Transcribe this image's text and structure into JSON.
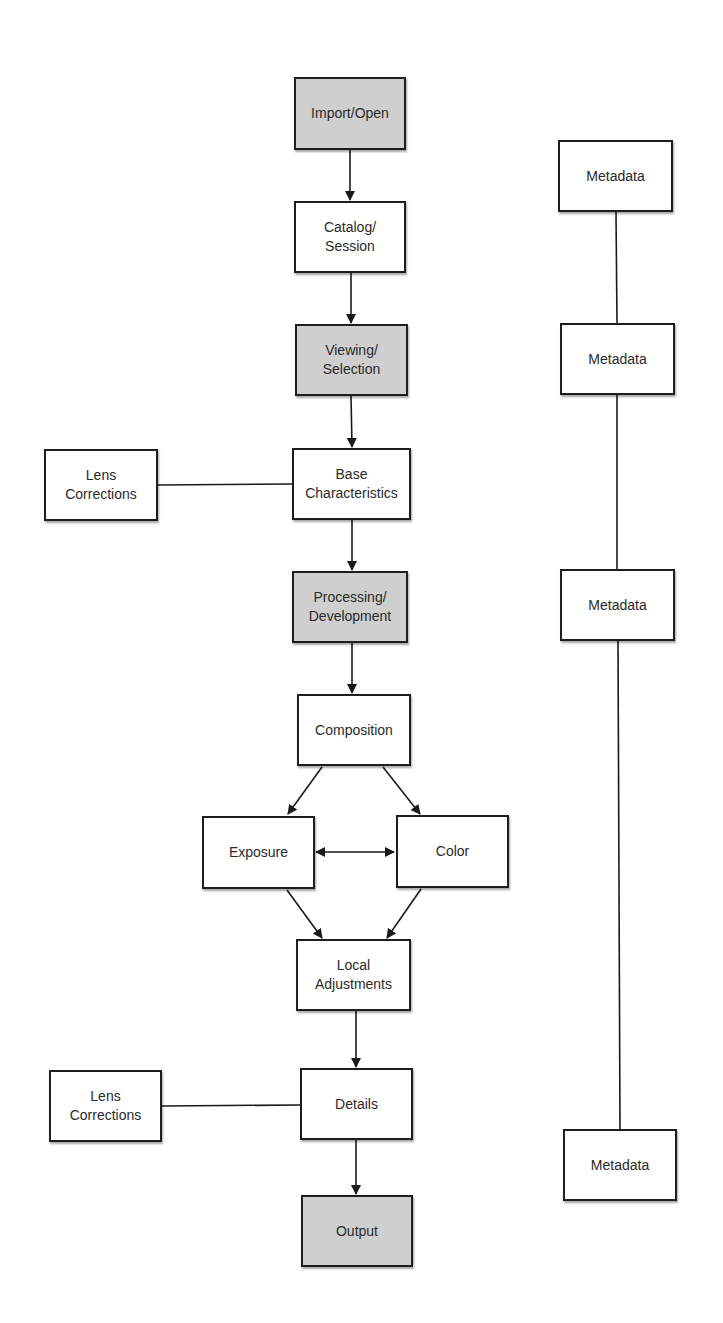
{
  "diagram": {
    "type": "flowchart",
    "background": "#ffffff",
    "colors": {
      "border": "#1e1e1e",
      "text": "#2a2a2a",
      "shaded_fill": "#cfcfcf",
      "plain_fill": "#ffffff",
      "edge": "#1a1a1a"
    },
    "nodes": [
      {
        "id": "import_open",
        "label": "Import/Open",
        "shaded": true,
        "x": 294,
        "y": 77,
        "w": 112,
        "h": 73
      },
      {
        "id": "catalog_session",
        "label": "Catalog/\nSession",
        "shaded": false,
        "x": 294,
        "y": 201,
        "w": 112,
        "h": 72
      },
      {
        "id": "viewing_selection",
        "label": "Viewing/\nSelection",
        "shaded": true,
        "x": 295,
        "y": 324,
        "w": 113,
        "h": 72
      },
      {
        "id": "base_characteristics",
        "label": "Base\nCharacteristics",
        "shaded": false,
        "x": 292,
        "y": 448,
        "w": 119,
        "h": 72
      },
      {
        "id": "lens_corrections_1",
        "label": "Lens\nCorrections",
        "shaded": false,
        "x": 44,
        "y": 449,
        "w": 114,
        "h": 72
      },
      {
        "id": "processing_development",
        "label": "Processing/\nDevelopment",
        "shaded": true,
        "x": 292,
        "y": 571,
        "w": 116,
        "h": 72
      },
      {
        "id": "composition",
        "label": "Composition",
        "shaded": false,
        "x": 297,
        "y": 694,
        "w": 114,
        "h": 72
      },
      {
        "id": "exposure",
        "label": "Exposure",
        "shaded": false,
        "x": 202,
        "y": 816,
        "w": 113,
        "h": 73
      },
      {
        "id": "color",
        "label": "Color",
        "shaded": false,
        "x": 396,
        "y": 815,
        "w": 113,
        "h": 73
      },
      {
        "id": "local_adjustments",
        "label": "Local\nAdjustments",
        "shaded": false,
        "x": 296,
        "y": 939,
        "w": 115,
        "h": 72
      },
      {
        "id": "details",
        "label": "Details",
        "shaded": false,
        "x": 300,
        "y": 1068,
        "w": 113,
        "h": 72
      },
      {
        "id": "lens_corrections_2",
        "label": "Lens\nCorrections",
        "shaded": false,
        "x": 49,
        "y": 1070,
        "w": 113,
        "h": 72
      },
      {
        "id": "output",
        "label": "Output",
        "shaded": true,
        "x": 301,
        "y": 1195,
        "w": 112,
        "h": 72
      },
      {
        "id": "metadata_1",
        "label": "Metadata",
        "shaded": false,
        "x": 558,
        "y": 140,
        "w": 115,
        "h": 72
      },
      {
        "id": "metadata_2",
        "label": "Metadata",
        "shaded": false,
        "x": 560,
        "y": 323,
        "w": 115,
        "h": 72
      },
      {
        "id": "metadata_3",
        "label": "Metadata",
        "shaded": false,
        "x": 560,
        "y": 569,
        "w": 115,
        "h": 72
      },
      {
        "id": "metadata_4",
        "label": "Metadata",
        "shaded": false,
        "x": 563,
        "y": 1129,
        "w": 114,
        "h": 72
      }
    ],
    "edges": [
      {
        "from": "import_open",
        "to": "catalog_session",
        "type": "arrow",
        "x1": 350,
        "y1": 150,
        "x2": 350,
        "y2": 200
      },
      {
        "from": "catalog_session",
        "to": "viewing_selection",
        "type": "arrow",
        "x1": 351,
        "y1": 273,
        "x2": 351,
        "y2": 323
      },
      {
        "from": "viewing_selection",
        "to": "base_characteristics",
        "type": "arrow",
        "x1": 351,
        "y1": 396,
        "x2": 352,
        "y2": 447
      },
      {
        "from": "lens_corrections_1",
        "to": "base_characteristics",
        "type": "line",
        "x1": 158,
        "y1": 485,
        "x2": 292,
        "y2": 484
      },
      {
        "from": "base_characteristics",
        "to": "processing_development",
        "type": "arrow",
        "x1": 352,
        "y1": 520,
        "x2": 352,
        "y2": 570
      },
      {
        "from": "processing_development",
        "to": "composition",
        "type": "arrow",
        "x1": 352,
        "y1": 643,
        "x2": 352,
        "y2": 693
      },
      {
        "from": "composition",
        "to": "exposure",
        "type": "arrow",
        "x1": 322,
        "y1": 767,
        "x2": 288,
        "y2": 814
      },
      {
        "from": "composition",
        "to": "color",
        "type": "arrow",
        "x1": 383,
        "y1": 767,
        "x2": 420,
        "y2": 814
      },
      {
        "from": "exposure",
        "to": "color",
        "type": "double-arrow",
        "x1": 316,
        "y1": 852,
        "x2": 394,
        "y2": 852
      },
      {
        "from": "exposure",
        "to": "local_adjustments",
        "type": "arrow",
        "x1": 287,
        "y1": 890,
        "x2": 322,
        "y2": 938
      },
      {
        "from": "color",
        "to": "local_adjustments",
        "type": "arrow",
        "x1": 421,
        "y1": 889,
        "x2": 387,
        "y2": 938
      },
      {
        "from": "local_adjustments",
        "to": "details",
        "type": "arrow",
        "x1": 356,
        "y1": 1011,
        "x2": 356,
        "y2": 1067
      },
      {
        "from": "lens_corrections_2",
        "to": "details",
        "type": "line",
        "x1": 162,
        "y1": 1106,
        "x2": 300,
        "y2": 1105
      },
      {
        "from": "details",
        "to": "output",
        "type": "arrow",
        "x1": 356,
        "y1": 1140,
        "x2": 356,
        "y2": 1194
      },
      {
        "from": "metadata_1",
        "to": "metadata_2",
        "type": "line",
        "x1": 616,
        "y1": 212,
        "x2": 617,
        "y2": 323
      },
      {
        "from": "metadata_2",
        "to": "metadata_3",
        "type": "line",
        "x1": 617,
        "y1": 395,
        "x2": 617,
        "y2": 569
      },
      {
        "from": "metadata_3",
        "to": "metadata_4",
        "type": "line",
        "x1": 618,
        "y1": 641,
        "x2": 620,
        "y2": 1129
      }
    ]
  }
}
